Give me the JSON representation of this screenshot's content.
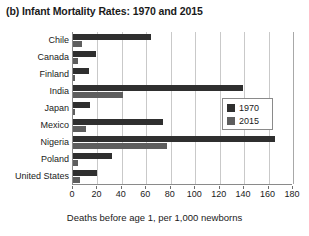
{
  "chart_data": {
    "type": "bar",
    "orientation": "horizontal",
    "title": "(b) Infant Mortality Rates: 1970 and 2015",
    "xlabel": "Deaths before age 1, per 1,000 newborns",
    "ylabel": "",
    "xlim": [
      0,
      180
    ],
    "xticks": [
      0,
      20,
      40,
      60,
      80,
      100,
      120,
      140,
      160,
      180
    ],
    "grid": "vertical",
    "legend_position": "center-right",
    "categories": [
      "Chile",
      "Canada",
      "Finland",
      "India",
      "Japan",
      "Mexico",
      "Nigeria",
      "Poland",
      "United States"
    ],
    "series": [
      {
        "name": "1970",
        "color": "#2f2f2f",
        "values": [
          64,
          19,
          13,
          139,
          14,
          74,
          165,
          32,
          20
        ]
      },
      {
        "name": "2015",
        "color": "#5e5e5e",
        "values": [
          7,
          4,
          2,
          41,
          2,
          11,
          77,
          4,
          6
        ]
      }
    ]
  },
  "legend": {
    "items": [
      {
        "label": "1970",
        "color": "#2f2f2f"
      },
      {
        "label": "2015",
        "color": "#5e5e5e"
      }
    ]
  }
}
